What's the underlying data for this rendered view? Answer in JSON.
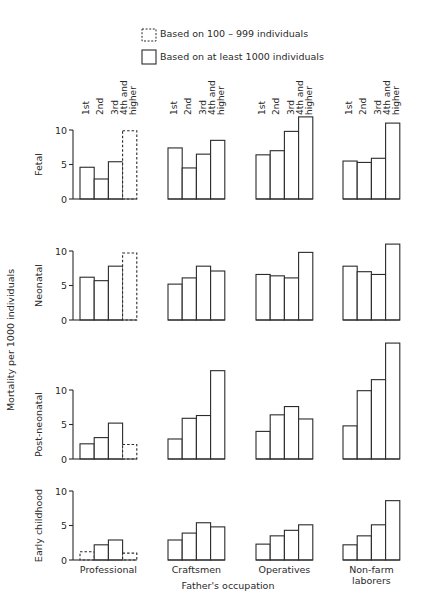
{
  "legend": {
    "dashed_label": "Based on 100 – 999 individuals",
    "solid_label": "Based on at least 1000 individuals"
  },
  "y_axis_label": "Mortality per 1000 individuals",
  "x_axis_label": "Father's occupation",
  "birth_order_labels": [
    "1st",
    "2nd",
    "3rd",
    "4th and",
    "higher"
  ],
  "chart_data": {
    "type": "bar",
    "title": "",
    "xlabel": "Father's occupation",
    "ylabel": "Mortality per 1000 individuals",
    "legend": [
      {
        "style": "dashed",
        "label": "Based on 100 – 999 individuals"
      },
      {
        "style": "solid",
        "label": "Based on at least 1000 individuals"
      }
    ],
    "groups": [
      "Professional",
      "Craftsmen",
      "Operatives",
      "Non-farm laborers"
    ],
    "categories": [
      "1st",
      "2nd",
      "3rd",
      "4th and higher"
    ],
    "panels": [
      {
        "name": "Fetal",
        "yticks": [
          0,
          5,
          10
        ],
        "ylim": [
          0,
          10
        ],
        "series": [
          {
            "group": "Professional",
            "values": [
              4.6,
              2.9,
              5.4,
              9.9
            ],
            "dashed": [
              false,
              false,
              false,
              true
            ]
          },
          {
            "group": "Craftsmen",
            "values": [
              7.4,
              4.5,
              6.5,
              8.5
            ],
            "dashed": [
              false,
              false,
              false,
              false
            ]
          },
          {
            "group": "Operatives",
            "values": [
              6.4,
              7.0,
              9.8,
              11.9
            ],
            "dashed": [
              false,
              false,
              false,
              false
            ]
          },
          {
            "group": "Non-farm laborers",
            "values": [
              5.5,
              5.3,
              5.9,
              11.0
            ],
            "dashed": [
              false,
              false,
              false,
              false
            ]
          }
        ]
      },
      {
        "name": "Neonatal",
        "yticks": [
          0,
          5,
          10
        ],
        "ylim": [
          0,
          10
        ],
        "series": [
          {
            "group": "Professional",
            "values": [
              6.2,
              5.7,
              7.8,
              9.7
            ],
            "dashed": [
              false,
              false,
              false,
              true
            ]
          },
          {
            "group": "Craftsmen",
            "values": [
              5.2,
              6.1,
              7.8,
              7.1
            ],
            "dashed": [
              false,
              false,
              false,
              false
            ]
          },
          {
            "group": "Operatives",
            "values": [
              6.6,
              6.4,
              6.1,
              9.8
            ],
            "dashed": [
              false,
              false,
              false,
              false
            ]
          },
          {
            "group": "Non-farm laborers",
            "values": [
              7.8,
              7.0,
              6.6,
              11.0
            ],
            "dashed": [
              false,
              false,
              false,
              false
            ]
          }
        ]
      },
      {
        "name": "Post-neonatal",
        "yticks": [
          0,
          5,
          10
        ],
        "ylim": [
          0,
          10
        ],
        "series": [
          {
            "group": "Professional",
            "values": [
              2.2,
              3.1,
              5.2,
              2.1
            ],
            "dashed": [
              false,
              false,
              false,
              true
            ]
          },
          {
            "group": "Craftsmen",
            "values": [
              2.9,
              5.9,
              6.3,
              12.8
            ],
            "dashed": [
              false,
              false,
              false,
              false
            ]
          },
          {
            "group": "Operatives",
            "values": [
              4.0,
              6.4,
              7.6,
              5.8
            ],
            "dashed": [
              false,
              false,
              false,
              false
            ]
          },
          {
            "group": "Non-farm laborers",
            "values": [
              4.8,
              9.9,
              11.5,
              16.8
            ],
            "dashed": [
              false,
              false,
              false,
              false
            ]
          }
        ]
      },
      {
        "name": "Early childhood",
        "yticks": [
          0,
          5,
          10
        ],
        "ylim": [
          0,
          10
        ],
        "series": [
          {
            "group": "Professional",
            "values": [
              1.2,
              2.2,
              2.9,
              1.0
            ],
            "dashed": [
              true,
              false,
              false,
              true
            ]
          },
          {
            "group": "Craftsmen",
            "values": [
              2.9,
              3.9,
              5.4,
              4.8
            ],
            "dashed": [
              false,
              false,
              false,
              false
            ]
          },
          {
            "group": "Operatives",
            "values": [
              2.3,
              3.5,
              4.3,
              5.1
            ],
            "dashed": [
              false,
              false,
              false,
              false
            ]
          },
          {
            "group": "Non-farm laborers",
            "values": [
              2.2,
              3.5,
              5.1,
              8.6
            ],
            "dashed": [
              false,
              false,
              false,
              false
            ]
          }
        ]
      }
    ]
  },
  "group_labels": [
    "Professional",
    "Craftsmen",
    "Operatives",
    [
      "Non-farm",
      "laborers"
    ]
  ]
}
